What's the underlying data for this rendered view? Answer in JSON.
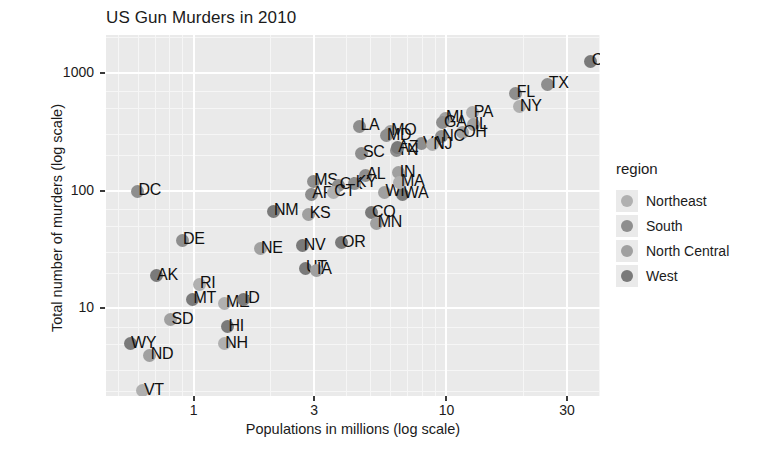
{
  "chart_data": {
    "type": "scatter",
    "title": "US Gun Murders in 2010",
    "xlabel": "Populations in millions (log scale)",
    "ylabel": "Total number of murders (log scale)",
    "xscale": "log",
    "yscale": "log",
    "xlim": [
      0.45,
      40.5
    ],
    "ylim": [
      1.8,
      2100
    ],
    "xticks": [
      1,
      3,
      10,
      30
    ],
    "xtick_labels": [
      "1",
      "3",
      "10",
      "30"
    ],
    "yticks": [
      10,
      100,
      1000
    ],
    "ytick_labels": [
      "10",
      "100",
      "1000"
    ],
    "grid": true,
    "legend_position": "right",
    "legend_title": "region",
    "series": [
      {
        "name": "Northeast",
        "color": "#b0b0b0"
      },
      {
        "name": "South",
        "color": "#8e8e8e"
      },
      {
        "name": "North Central",
        "color": "#a0a0a0"
      },
      {
        "name": "West",
        "color": "#7a7a7a"
      }
    ],
    "points": [
      {
        "label": "CA",
        "x": 37.25,
        "y": 1257,
        "region": "West"
      },
      {
        "label": "TX",
        "x": 25.15,
        "y": 805,
        "region": "South"
      },
      {
        "label": "FL",
        "x": 18.8,
        "y": 669,
        "region": "South"
      },
      {
        "label": "NY",
        "x": 19.38,
        "y": 517,
        "region": "Northeast"
      },
      {
        "label": "PA",
        "x": 12.7,
        "y": 457,
        "region": "Northeast"
      },
      {
        "label": "MI",
        "x": 9.88,
        "y": 413,
        "region": "North Central"
      },
      {
        "label": "IL",
        "x": 12.83,
        "y": 364,
        "region": "North Central"
      },
      {
        "label": "LA",
        "x": 4.53,
        "y": 351,
        "region": "South"
      },
      {
        "label": "MO",
        "x": 5.99,
        "y": 321,
        "region": "North Central"
      },
      {
        "label": "GA",
        "x": 9.69,
        "y": 376,
        "region": "South"
      },
      {
        "label": "OH",
        "x": 11.54,
        "y": 310,
        "region": "North Central"
      },
      {
        "label": "NC",
        "x": 9.53,
        "y": 286,
        "region": "South"
      },
      {
        "label": "SC",
        "x": 4.63,
        "y": 207,
        "region": "South"
      },
      {
        "label": "MD",
        "x": 5.77,
        "y": 293,
        "region": "South"
      },
      {
        "label": "VA",
        "x": 8.0,
        "y": 250,
        "region": "South"
      },
      {
        "label": "TN",
        "x": 6.35,
        "y": 219,
        "region": "South"
      },
      {
        "label": "NJ",
        "x": 8.79,
        "y": 246,
        "region": "Northeast"
      },
      {
        "label": "AZ",
        "x": 6.39,
        "y": 232,
        "region": "West"
      },
      {
        "label": "IN",
        "x": 6.48,
        "y": 142,
        "region": "North Central"
      },
      {
        "label": "AL",
        "x": 4.78,
        "y": 135,
        "region": "South"
      },
      {
        "label": "WA",
        "x": 6.72,
        "y": 93,
        "region": "West"
      },
      {
        "label": "MS",
        "x": 2.97,
        "y": 120,
        "region": "South"
      },
      {
        "label": "AR",
        "x": 2.92,
        "y": 93,
        "region": "South"
      },
      {
        "label": "OK",
        "x": 3.75,
        "y": 111,
        "region": "South"
      },
      {
        "label": "KY",
        "x": 4.34,
        "y": 116,
        "region": "South"
      },
      {
        "label": "WI",
        "x": 5.69,
        "y": 97,
        "region": "North Central"
      },
      {
        "label": "CT",
        "x": 3.57,
        "y": 97,
        "region": "Northeast"
      },
      {
        "label": "MA",
        "x": 6.55,
        "y": 118,
        "region": "Northeast"
      },
      {
        "label": "CO",
        "x": 5.03,
        "y": 65,
        "region": "West"
      },
      {
        "label": "MN",
        "x": 5.3,
        "y": 53,
        "region": "North Central"
      },
      {
        "label": "NM",
        "x": 2.06,
        "y": 67,
        "region": "West"
      },
      {
        "label": "KS",
        "x": 2.85,
        "y": 63,
        "region": "North Central"
      },
      {
        "label": "DC",
        "x": 0.6,
        "y": 99,
        "region": "South"
      },
      {
        "label": "OR",
        "x": 3.83,
        "y": 36,
        "region": "West"
      },
      {
        "label": "NE",
        "x": 1.83,
        "y": 32,
        "region": "North Central"
      },
      {
        "label": "NV",
        "x": 2.7,
        "y": 34,
        "region": "West"
      },
      {
        "label": "UT",
        "x": 2.76,
        "y": 22,
        "region": "West"
      },
      {
        "label": "IA",
        "x": 3.05,
        "y": 21,
        "region": "North Central"
      },
      {
        "label": "DE",
        "x": 0.9,
        "y": 38,
        "region": "South"
      },
      {
        "label": "AK",
        "x": 0.71,
        "y": 19,
        "region": "West"
      },
      {
        "label": "RI",
        "x": 1.05,
        "y": 16,
        "region": "Northeast"
      },
      {
        "label": "MT",
        "x": 0.99,
        "y": 12,
        "region": "West"
      },
      {
        "label": "ME",
        "x": 1.33,
        "y": 11,
        "region": "Northeast"
      },
      {
        "label": "ID",
        "x": 1.57,
        "y": 12,
        "region": "West"
      },
      {
        "label": "SD",
        "x": 0.81,
        "y": 8,
        "region": "North Central"
      },
      {
        "label": "HI",
        "x": 1.36,
        "y": 7,
        "region": "West"
      },
      {
        "label": "NH",
        "x": 1.32,
        "y": 5,
        "region": "Northeast"
      },
      {
        "label": "WY",
        "x": 0.56,
        "y": 5,
        "region": "West"
      },
      {
        "label": "ND",
        "x": 0.67,
        "y": 4,
        "region": "North Central"
      },
      {
        "label": "VT",
        "x": 0.63,
        "y": 2,
        "region": "Northeast"
      }
    ]
  }
}
